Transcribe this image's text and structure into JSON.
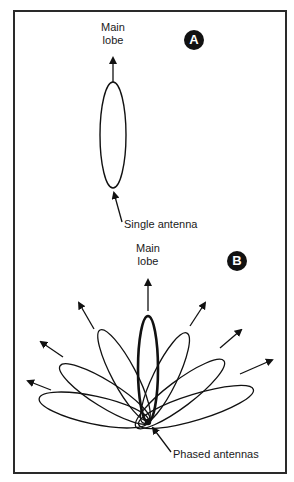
{
  "panel_a": {
    "badge": "A",
    "main_lobe_label_line1": "Main",
    "main_lobe_label_line2": "lobe",
    "antenna_label": "Single antenna"
  },
  "panel_b": {
    "badge": "B",
    "main_lobe_label_line1": "Main",
    "main_lobe_label_line2": "lobe",
    "antenna_label": "Phased antennas",
    "lobe_count": 7
  },
  "colors": {
    "ink": "#1a1a1a",
    "background": "#ffffff"
  }
}
